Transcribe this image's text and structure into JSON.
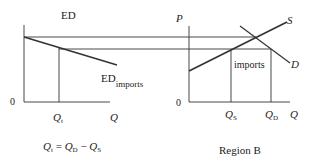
{
  "left_panel": {
    "title": "ED",
    "origin": "0",
    "x_axis_label": "Q",
    "qt_label": "Q",
    "qt_sub": "t",
    "curve_label": "ED",
    "curve_sub": "imports",
    "equation": {
      "lhs": "Q",
      "lhs_sub": "t",
      "eq": " = ",
      "a": "Q",
      "a_sub": "D",
      "minus": " − ",
      "b": "Q",
      "b_sub": "S"
    }
  },
  "right_panel": {
    "y_axis_label": "P",
    "origin": "0",
    "x_axis_label": "Q",
    "supply_label": "S",
    "demand_label": "D",
    "imports_label": "imports",
    "qs_label": "Q",
    "qs_sub": "S",
    "qd_label": "Q",
    "qd_sub": "D",
    "caption": "Region B"
  }
}
